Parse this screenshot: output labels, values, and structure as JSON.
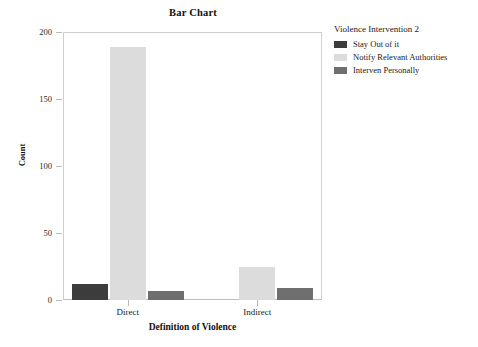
{
  "chart_data": {
    "type": "bar",
    "title": "Bar Chart",
    "xlabel": "Definition of Violence",
    "ylabel": "Count",
    "categories": [
      "Direct",
      "Indirect"
    ],
    "series": [
      {
        "name": "Stay Out of it",
        "values": [
          12,
          0
        ],
        "color": "#3c3c3c"
      },
      {
        "name": "Notify Relevant Authorities",
        "values": [
          189,
          25
        ],
        "color": "#dcdcdc"
      },
      {
        "name": "Interven Personally",
        "values": [
          7,
          9
        ],
        "color": "#6f6f6f"
      }
    ],
    "legend_title": "Violence Intervention 2",
    "legend_position": "right",
    "ylim": [
      0,
      200
    ],
    "yticks": [
      0,
      50,
      100,
      150,
      200
    ],
    "ytick_labels": [
      "0",
      "50",
      "100",
      "150",
      "200"
    ],
    "grid": false,
    "frame": true
  },
  "colors": {
    "background": "#ffffff",
    "frame": "#cfcfcf",
    "tick": "#b9b9b9",
    "text": "#1a1a1a"
  }
}
